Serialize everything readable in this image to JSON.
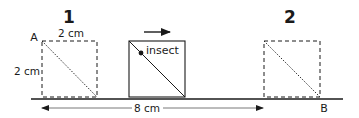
{
  "diagram": {
    "positions": [
      {
        "label": "1",
        "corner_label": "A",
        "style": "dashed"
      },
      {
        "label": "2",
        "corner_label": "B",
        "style": "dashed"
      }
    ],
    "moving_box": {
      "label": "insect",
      "direction": "right",
      "style": "solid"
    },
    "dimensions": {
      "box_width": "2 cm",
      "box_height": "2 cm",
      "displacement": "8 cm"
    },
    "colors": {
      "stroke": "#1a1a1a",
      "background": "#ffffff"
    }
  }
}
